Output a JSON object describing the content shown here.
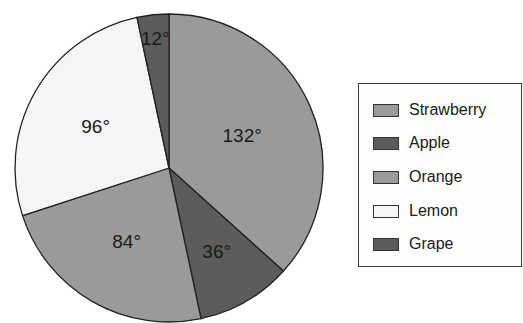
{
  "chart_data": {
    "type": "pie",
    "title": "",
    "unit": "degrees",
    "start_angle": "12 o'clock",
    "direction": "clockwise",
    "categories": [
      "Strawberry",
      "Apple",
      "Orange",
      "Lemon",
      "Grape"
    ],
    "values": [
      132,
      36,
      84,
      96,
      12
    ],
    "labels": [
      "132°",
      "36°",
      "84°",
      "96°",
      "12°"
    ],
    "colors": [
      "#9a9a9a",
      "#5c5c5c",
      "#9a9a9a",
      "#f5f5f5",
      "#5c5c5c"
    ],
    "legend_position": "right"
  },
  "legend": {
    "items": [
      {
        "label": "Strawberry",
        "color": "#9a9a9a"
      },
      {
        "label": "Apple",
        "color": "#5c5c5c"
      },
      {
        "label": "Orange",
        "color": "#9a9a9a"
      },
      {
        "label": "Lemon",
        "color": "#f5f5f5"
      },
      {
        "label": "Grape",
        "color": "#5c5c5c"
      }
    ]
  }
}
